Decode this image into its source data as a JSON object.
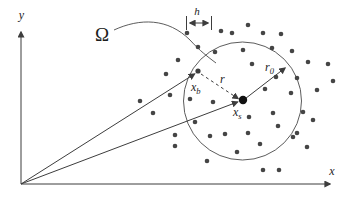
{
  "figure": {
    "background_color": "#ffffff",
    "ink_color": "#3d3d3d",
    "dot_color": "#454545",
    "labels": {
      "x_axis": "x",
      "y_axis": "y",
      "domain": "Ω",
      "spacing": "h",
      "radius_inner": "r",
      "radius_outer_base": "r",
      "radius_outer_sub": "0",
      "point_b_base": "x",
      "point_b_sub": "b",
      "point_s_base": "x",
      "point_s_sub": "s"
    },
    "geometry": {
      "origin": [
        21,
        184
      ],
      "support_circle_center": [
        242.5,
        101
      ],
      "support_circle_radius": 59,
      "center_node_xs": [
        243,
        100
      ],
      "boundary_node_xb": [
        198,
        71
      ],
      "node_dot_radius": 2.3,
      "center_dot_radius": 4.2,
      "spacing_arrow": {
        "x1": 186.5,
        "x2": 211.5,
        "y": 23
      }
    },
    "nodes": [
      [
        187,
        33
      ],
      [
        221,
        31
      ],
      [
        232,
        33
      ],
      [
        248,
        25
      ],
      [
        263,
        33
      ],
      [
        281,
        34
      ],
      [
        198,
        47
      ],
      [
        215,
        52
      ],
      [
        243,
        50
      ],
      [
        272,
        48
      ],
      [
        292,
        51
      ],
      [
        178,
        60
      ],
      [
        308,
        62
      ],
      [
        328,
        64
      ],
      [
        252,
        64
      ],
      [
        166,
        74
      ],
      [
        276,
        77
      ],
      [
        297,
        78
      ],
      [
        333,
        81
      ],
      [
        317,
        90
      ],
      [
        170,
        95
      ],
      [
        140,
        101
      ],
      [
        190,
        99
      ],
      [
        213,
        102
      ],
      [
        265,
        89
      ],
      [
        291,
        93
      ],
      [
        153,
        113
      ],
      [
        249,
        117
      ],
      [
        273,
        113
      ],
      [
        303,
        112
      ],
      [
        313,
        120
      ],
      [
        175,
        135
      ],
      [
        175,
        146
      ],
      [
        195,
        122
      ],
      [
        278,
        126
      ],
      [
        248,
        133
      ],
      [
        297,
        133
      ],
      [
        210,
        136
      ],
      [
        225,
        134
      ],
      [
        237,
        152
      ],
      [
        260,
        144
      ],
      [
        293,
        137
      ],
      [
        307,
        147
      ],
      [
        207,
        161
      ],
      [
        263,
        170
      ],
      [
        279,
        170
      ]
    ]
  }
}
